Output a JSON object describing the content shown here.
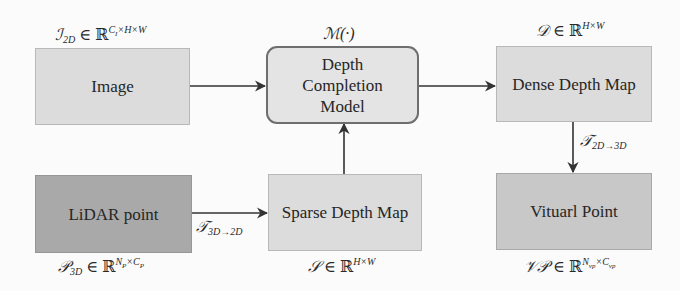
{
  "nodes": {
    "image": {
      "label": "Image",
      "annotation": {
        "base": "ℐ",
        "sub": "2D",
        "rel": " ∈ ",
        "set": "ℝ",
        "sup": "C_I×H×W"
      }
    },
    "depth_completion_model": {
      "label_lines": [
        "Depth",
        "Completion",
        "Model"
      ],
      "annotation": {
        "text": "ℳ(·)"
      }
    },
    "dense_depth_map": {
      "label": "Dense Depth Map",
      "annotation": {
        "base": "𝒟",
        "rel": " ∈ ",
        "set": "ℝ",
        "sup": "H×W"
      }
    },
    "lidar_point": {
      "label": "LiDAR point",
      "annotation": {
        "base": "𝒫",
        "sub": "3D",
        "rel": " ∈ ",
        "set": "ℝ",
        "sup": "N_P×C_P"
      }
    },
    "sparse_depth_map": {
      "label": "Sparse Depth Map",
      "annotation": {
        "base": "𝒮",
        "rel": " ∈ ",
        "set": "ℝ",
        "sup": "H×W"
      }
    },
    "virtual_point": {
      "label": "Vituarl Point",
      "annotation": {
        "base": "𝒱𝒫",
        "rel": " ∈ ",
        "set": "ℝ",
        "sup": "N_vp×C_vp"
      }
    }
  },
  "edges": [
    {
      "from": "image",
      "to": "depth_completion_model",
      "label": ""
    },
    {
      "from": "depth_completion_model",
      "to": "dense_depth_map",
      "label": ""
    },
    {
      "from": "dense_depth_map",
      "to": "virtual_point",
      "label": {
        "base": "𝒯",
        "sub": "2D→3D"
      }
    },
    {
      "from": "lidar_point",
      "to": "sparse_depth_map",
      "label": {
        "base": "𝒯",
        "sub": "3D→2D"
      }
    },
    {
      "from": "sparse_depth_map",
      "to": "depth_completion_model",
      "label": ""
    }
  ],
  "colors": {
    "arrow": "#333333",
    "light_box": "#dcdcdc",
    "dark_box": "#a9a9a9",
    "mid_box": "#c8c8c8",
    "model_box": "#e4e4e4"
  }
}
